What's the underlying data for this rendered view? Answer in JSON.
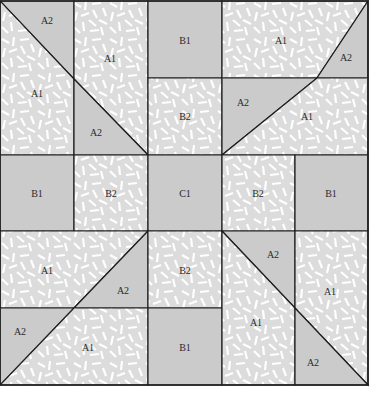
{
  "colors": {
    "light_print": "#dcdcdc",
    "medium_solid": "#cbcbcb",
    "print_streak": "#ffffff",
    "line": "#1e1e1e"
  },
  "legend_fabrics": {
    "A1": "light print",
    "A2": "medium solid",
    "B1": "medium solid",
    "B2": "light print",
    "C1": "medium solid"
  },
  "pieces": [
    {
      "id": "tl-a2-top",
      "label": "A2",
      "fabric": "solid"
    },
    {
      "id": "tl-a1-left",
      "label": "A1",
      "fabric": "print"
    },
    {
      "id": "tl-a1-right",
      "label": "A1",
      "fabric": "print"
    },
    {
      "id": "tl-a2-bottom",
      "label": "A2",
      "fabric": "solid"
    },
    {
      "id": "top-b1",
      "label": "B1",
      "fabric": "solid"
    },
    {
      "id": "top-b2",
      "label": "B2",
      "fabric": "print"
    },
    {
      "id": "tr-a1-top",
      "label": "A1",
      "fabric": "print"
    },
    {
      "id": "tr-a2-top",
      "label": "A2",
      "fabric": "solid"
    },
    {
      "id": "tr-a2-bottom",
      "label": "A2",
      "fabric": "solid"
    },
    {
      "id": "tr-a1-bottom",
      "label": "A1",
      "fabric": "print"
    },
    {
      "id": "mid-b1-left",
      "label": "B1",
      "fabric": "solid"
    },
    {
      "id": "mid-b2-left",
      "label": "B2",
      "fabric": "print"
    },
    {
      "id": "mid-c1",
      "label": "C1",
      "fabric": "solid"
    },
    {
      "id": "mid-b2-right",
      "label": "B2",
      "fabric": "print"
    },
    {
      "id": "mid-b1-right",
      "label": "B1",
      "fabric": "solid"
    },
    {
      "id": "bl-a1-top",
      "label": "A1",
      "fabric": "print"
    },
    {
      "id": "bl-a2-top",
      "label": "A2",
      "fabric": "solid"
    },
    {
      "id": "bl-a2-bottom",
      "label": "A2",
      "fabric": "solid"
    },
    {
      "id": "bl-a1-bottom",
      "label": "A1",
      "fabric": "print"
    },
    {
      "id": "bottom-b2",
      "label": "B2",
      "fabric": "print"
    },
    {
      "id": "bottom-b1",
      "label": "B1",
      "fabric": "solid"
    },
    {
      "id": "br-a2-top",
      "label": "A2",
      "fabric": "solid"
    },
    {
      "id": "br-a1-left",
      "label": "A1",
      "fabric": "print"
    },
    {
      "id": "br-a1-right",
      "label": "A1",
      "fabric": "print"
    },
    {
      "id": "br-a2-bottom",
      "label": "A2",
      "fabric": "solid"
    }
  ]
}
